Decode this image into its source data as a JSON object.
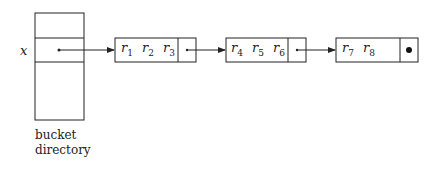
{
  "directory": {
    "row_label": "x",
    "caption_line1": "bucket",
    "caption_line2": "directory"
  },
  "buckets": [
    {
      "records": [
        {
          "name": "r",
          "sub": "1"
        },
        {
          "name": "r",
          "sub": "2"
        },
        {
          "name": "r",
          "sub": "3"
        }
      ],
      "pointer": "next"
    },
    {
      "records": [
        {
          "name": "r",
          "sub": "4"
        },
        {
          "name": "r",
          "sub": "5"
        },
        {
          "name": "r",
          "sub": "6"
        }
      ],
      "pointer": "next"
    },
    {
      "records": [
        {
          "name": "r",
          "sub": "7"
        },
        {
          "name": "r",
          "sub": "8"
        }
      ],
      "pointer": "null"
    }
  ]
}
